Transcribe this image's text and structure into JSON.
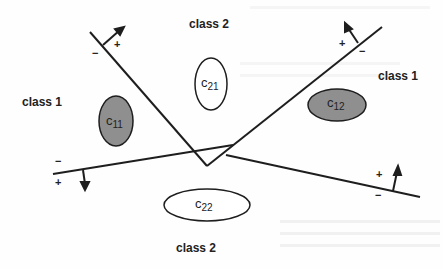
{
  "diagram": {
    "labels": {
      "class2_top": "class 2",
      "class1_left": "class 1",
      "class1_right": "class 1",
      "class2_bottom": "class 2"
    },
    "clusters": [
      {
        "id": "c11",
        "main": "c",
        "sub": "11",
        "fill": "#8f8f8f"
      },
      {
        "id": "c21",
        "main": "c",
        "sub": "21",
        "fill": "#ffffff"
      },
      {
        "id": "c12",
        "main": "c",
        "sub": "12",
        "fill": "#8f8f8f"
      },
      {
        "id": "c22",
        "main": "c",
        "sub": "22",
        "fill": "#ffffff"
      }
    ],
    "hyperplanes": [
      {
        "id": "h1",
        "plus": "+",
        "minus": "−"
      },
      {
        "id": "h2",
        "plus": "+",
        "minus": "−"
      },
      {
        "id": "h3",
        "plus": "+",
        "minus": "−"
      },
      {
        "id": "h4",
        "plus": "+",
        "minus": "−"
      }
    ],
    "colors": {
      "line": "#1e1e1e",
      "shaded_cluster": "#8f8f8f",
      "background": "#fefefe"
    }
  }
}
